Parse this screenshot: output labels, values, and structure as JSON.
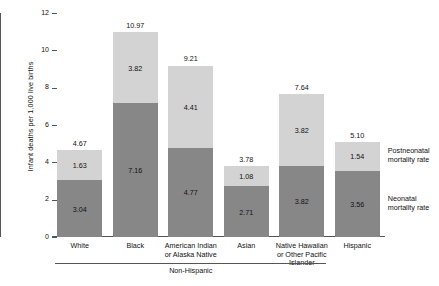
{
  "chart_data": {
    "type": "bar",
    "subtype": "stacked-bar",
    "title": "",
    "xlabel": "",
    "ylabel": "Infant deaths per 1,000 live births",
    "ylim": [
      0,
      12
    ],
    "yticks": [
      0,
      2,
      4,
      6,
      8,
      10,
      12
    ],
    "ytick_labels": [
      "0",
      "2",
      "4",
      "6",
      "8",
      "10",
      "12"
    ],
    "grid": false,
    "legend_position": "right",
    "categories": [
      "White",
      "Black",
      "American Indian\nor Alaska Native",
      "Asian",
      "Native Hawaiian\nor Other Pacific\nIslander",
      "Hispanic"
    ],
    "category_lines": [
      [
        "White"
      ],
      [
        "Black"
      ],
      [
        "American Indian",
        "or Alaska Native"
      ],
      [
        "Asian"
      ],
      [
        "Native Hawaiian",
        "or Other Pacific",
        "Islander"
      ],
      [
        "Hispanic"
      ]
    ],
    "series": [
      {
        "name": "Neonatal mortality rate",
        "color": "#878787",
        "values": [
          3.04,
          7.16,
          4.77,
          2.71,
          3.82,
          3.56
        ],
        "value_labels": [
          "3.04",
          "7.16",
          "4.77",
          "2.71",
          "3.82",
          "3.56"
        ]
      },
      {
        "name": "Postneonatal mortality rate",
        "color": "#d3d3d3",
        "values": [
          1.63,
          3.82,
          4.41,
          1.08,
          3.82,
          1.54
        ],
        "value_labels": [
          "1.63",
          "3.82",
          "4.41",
          "1.08",
          "3.82",
          "1.54"
        ]
      }
    ],
    "totals": [
      4.67,
      10.97,
      9.21,
      3.78,
      7.64,
      5.1
    ],
    "total_labels": [
      "4.67",
      "10.97",
      "9.21",
      "3.78",
      "7.64",
      "5.10"
    ],
    "group_bracket": {
      "label": "Non-Hispanic",
      "spans_categories": [
        "White",
        "Black",
        "American Indian or Alaska Native",
        "Asian",
        "Native Hawaiian or Other Pacific Islander"
      ]
    },
    "legend": [
      {
        "label_line1": "Postneonatal",
        "label_line2": "mortality rate",
        "color": "#d3d3d3"
      },
      {
        "label_line1": "Neonatal",
        "label_line2": "mortality rate",
        "color": "#878787"
      }
    ]
  }
}
